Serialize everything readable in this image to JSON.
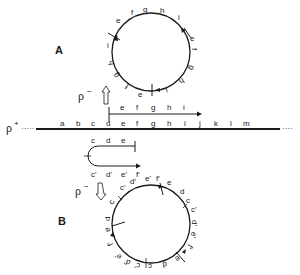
{
  "panel_labels": {
    "a": "A",
    "b": "B"
  },
  "strand_labels": {
    "rho_plus": "ρ",
    "rho_plus_sup": "+",
    "rho_minus_a": "ρ",
    "rho_minus_a_sup": "−",
    "rho_minus_b": "ρ",
    "rho_minus_b_sup": "−",
    "dots_left": "·····",
    "dots_right": "····"
  },
  "main_strand": {
    "letters": [
      "a",
      "b",
      "c",
      "d",
      "e",
      "f",
      "g",
      "h",
      "i",
      "j",
      "k",
      "l",
      "m"
    ]
  },
  "upper_arrow": {
    "letters": [
      "e",
      "f",
      "g",
      "h",
      "i"
    ]
  },
  "hairpin": {
    "top_letters": [
      "c",
      "d",
      "e"
    ],
    "bottom_letters": [
      "c'",
      "d'",
      "e'",
      "f'"
    ]
  },
  "circle_a": {
    "letters": [
      "e",
      "f",
      "g",
      "h",
      "i",
      "e",
      "f",
      "g",
      "h",
      "i",
      "e",
      "f",
      "g",
      "h",
      "i"
    ]
  },
  "circle_b": {
    "letters": [
      "c'",
      "d'",
      "e'",
      "f'",
      "e",
      "d",
      "c",
      "c'",
      "d'",
      "e'",
      "f'",
      "e",
      "d",
      "c",
      "c'",
      "d'",
      "e'",
      "f'",
      "e",
      "d",
      "c"
    ]
  },
  "colors": {
    "ink": "#1a1a1a",
    "background": "#ffffff"
  }
}
